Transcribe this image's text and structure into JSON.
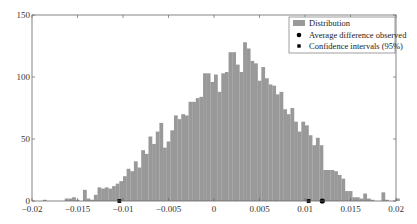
{
  "chart_data": {
    "type": "bar",
    "title": "",
    "xlabel": "",
    "ylabel": "",
    "xlim": [
      -0.02,
      0.02
    ],
    "ylim": [
      0,
      150
    ],
    "grid": false,
    "legend_position": "upper right",
    "xticks": [
      -0.02,
      -0.015,
      -0.01,
      -0.005,
      0,
      0.005,
      0.01,
      0.015,
      0.02
    ],
    "xtick_labels": [
      "-0.02",
      "-0.015",
      "-0.01",
      "-0.005",
      "0",
      "0.005",
      "0.01",
      "0.015",
      "0.02"
    ],
    "yticks": [
      0,
      50,
      100,
      150
    ],
    "ytick_labels": [
      "0",
      "50",
      "100",
      "150"
    ],
    "bar_color": "#999999",
    "series": [
      {
        "name": "Distribution",
        "kind": "histogram",
        "bin_start": -0.0188,
        "bin_width": 0.0004,
        "values": [
          1,
          0,
          0,
          0,
          0,
          0,
          2,
          2,
          3,
          1,
          0,
          9,
          2,
          1,
          5,
          11,
          10,
          11,
          10,
          12,
          14,
          16,
          20,
          26,
          24,
          32,
          27,
          41,
          38,
          52,
          46,
          56,
          63,
          43,
          48,
          57,
          69,
          66,
          70,
          69,
          80,
          80,
          83,
          84,
          103,
          103,
          96,
          102,
          88,
          103,
          104,
          120,
          120,
          110,
          104,
          128,
          123,
          113,
          111,
          97,
          108,
          99,
          94,
          93,
          86,
          88,
          74,
          70,
          75,
          64,
          56,
          64,
          61,
          53,
          45,
          51,
          45,
          25,
          25,
          25,
          24,
          21,
          18,
          8,
          8,
          3,
          3,
          2,
          6,
          2,
          1,
          0,
          0,
          7,
          1,
          0,
          0,
          2,
          0,
          0,
          0,
          0,
          0,
          0
        ],
        "color": "#999999"
      },
      {
        "name": "Average difference observed",
        "kind": "marker",
        "marker": "circle",
        "points": [
          {
            "x": 0.0119,
            "y": 0
          }
        ],
        "color": "#000000"
      },
      {
        "name": "Confidence intervals (95%)",
        "kind": "marker",
        "marker": "square",
        "points": [
          {
            "x": -0.0104,
            "y": 0
          },
          {
            "x": 0.0104,
            "y": 0
          }
        ],
        "color": "#000000"
      }
    ],
    "legend": [
      "Distribution",
      "Average difference observed",
      "Confidence intervals (95%)"
    ]
  }
}
